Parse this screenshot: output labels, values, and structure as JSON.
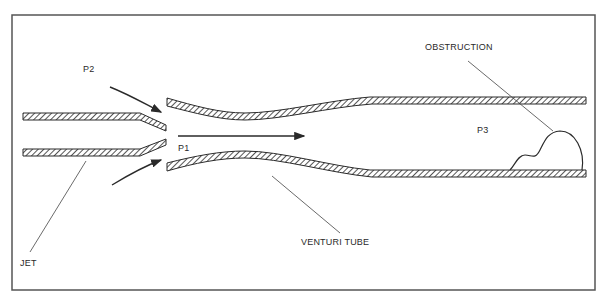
{
  "diagram": {
    "type": "venturi-jet-schematic",
    "labels": {
      "p2": "P2",
      "p1": "P1",
      "p3": "P3",
      "obstruction": "OBSTRUCTION",
      "venturi_tube": "VENTURI TUBE",
      "jet": "JET"
    },
    "colors": {
      "line": "#2a2a2a",
      "frame": "#555555",
      "background": "#ffffff"
    }
  }
}
